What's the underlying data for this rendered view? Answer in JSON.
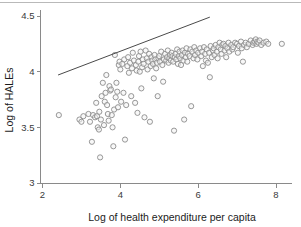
{
  "chart_data": {
    "type": "scatter",
    "title": "",
    "xlabel": "Log of health expenditure per capita",
    "ylabel": "Log of HALEs",
    "xlim": [
      2,
      8.5
    ],
    "ylim": [
      3,
      4.55
    ],
    "xticks": [
      2,
      4,
      6,
      8
    ],
    "xtick_labels": [
      "2",
      "4",
      "6",
      "8"
    ],
    "yticks": [
      3,
      3.5,
      4,
      4.5
    ],
    "ytick_labels": [
      "3",
      "3.5",
      "4",
      "4.5"
    ],
    "grid": false,
    "legend": null,
    "marker": {
      "shape": "circle-open",
      "radius_px": 2.6,
      "stroke_color": "#8c8c8c",
      "fill_color": "#f2f2f2"
    },
    "annotations": [
      {
        "type": "line",
        "name": "frontier-line",
        "color": "#4a4a4a",
        "x_start": 2.4,
        "y_start": 3.97,
        "x_end": 6.3,
        "y_end": 4.49
      }
    ],
    "points": [
      [
        2.42,
        3.61
      ],
      [
        2.95,
        3.57
      ],
      [
        3.0,
        3.55
      ],
      [
        3.05,
        3.6
      ],
      [
        3.18,
        3.62
      ],
      [
        3.22,
        3.55
      ],
      [
        3.27,
        3.37
      ],
      [
        3.3,
        3.61
      ],
      [
        3.35,
        3.59
      ],
      [
        3.38,
        3.72
      ],
      [
        3.4,
        3.6
      ],
      [
        3.42,
        3.5
      ],
      [
        3.45,
        3.48
      ],
      [
        3.46,
        3.64
      ],
      [
        3.48,
        3.23
      ],
      [
        3.5,
        3.57
      ],
      [
        3.52,
        3.78
      ],
      [
        3.55,
        3.9
      ],
      [
        3.58,
        3.52
      ],
      [
        3.6,
        3.73
      ],
      [
        3.62,
        3.81
      ],
      [
        3.64,
        3.97
      ],
      [
        3.66,
        3.7
      ],
      [
        3.68,
        3.62
      ],
      [
        3.7,
        3.56
      ],
      [
        3.72,
        3.87
      ],
      [
        3.74,
        3.83
      ],
      [
        3.76,
        3.84
      ],
      [
        3.78,
        3.61
      ],
      [
        3.8,
        3.5
      ],
      [
        3.82,
        3.33
      ],
      [
        3.84,
        3.66
      ],
      [
        3.86,
        4.15
      ],
      [
        3.88,
        3.77
      ],
      [
        3.9,
        3.9
      ],
      [
        3.92,
        3.82
      ],
      [
        3.94,
        3.68
      ],
      [
        3.96,
        4.06
      ],
      [
        3.98,
        4.09
      ],
      [
        4.0,
        4.02
      ],
      [
        4.02,
        3.73
      ],
      [
        4.05,
        4.07
      ],
      [
        4.08,
        3.81
      ],
      [
        4.1,
        4.11
      ],
      [
        4.12,
        3.39
      ],
      [
        4.15,
        3.7
      ],
      [
        4.18,
        4.05
      ],
      [
        4.2,
        4.13
      ],
      [
        4.22,
        3.99
      ],
      [
        4.25,
        4.08
      ],
      [
        4.28,
        3.78
      ],
      [
        4.3,
        4.03
      ],
      [
        4.32,
        4.17
      ],
      [
        4.35,
        4.1
      ],
      [
        4.38,
        3.72
      ],
      [
        4.4,
        4.06
      ],
      [
        4.42,
        4.01
      ],
      [
        4.44,
        3.63
      ],
      [
        4.46,
        4.09
      ],
      [
        4.48,
        4.14
      ],
      [
        4.5,
        4.0
      ],
      [
        4.52,
        4.18
      ],
      [
        4.54,
        3.85
      ],
      [
        4.56,
        4.04
      ],
      [
        4.58,
        4.11
      ],
      [
        4.6,
        4.07
      ],
      [
        4.62,
        3.59
      ],
      [
        4.65,
        4.19
      ],
      [
        4.68,
        4.12
      ],
      [
        4.7,
        4.02
      ],
      [
        4.72,
        4.09
      ],
      [
        4.74,
        4.16
      ],
      [
        4.76,
        3.55
      ],
      [
        4.78,
        4.05
      ],
      [
        4.8,
        4.13
      ],
      [
        4.82,
        4.1
      ],
      [
        4.84,
        4.07
      ],
      [
        4.86,
        3.94
      ],
      [
        4.88,
        4.15
      ],
      [
        4.9,
        4.11
      ],
      [
        4.92,
        4.03
      ],
      [
        4.94,
        4.08
      ],
      [
        4.96,
        3.78
      ],
      [
        4.98,
        4.12
      ],
      [
        5.0,
        4.14
      ],
      [
        5.02,
        4.09
      ],
      [
        5.05,
        4.18
      ],
      [
        5.08,
        4.06
      ],
      [
        5.1,
        3.91
      ],
      [
        5.12,
        4.11
      ],
      [
        5.15,
        4.16
      ],
      [
        5.18,
        4.1
      ],
      [
        5.2,
        4.13
      ],
      [
        5.22,
        4.19
      ],
      [
        5.24,
        4.08
      ],
      [
        5.26,
        4.12
      ],
      [
        5.28,
        4.15
      ],
      [
        5.3,
        4.1
      ],
      [
        5.32,
        4.17
      ],
      [
        5.34,
        4.14
      ],
      [
        5.36,
        4.09
      ],
      [
        5.38,
        3.47
      ],
      [
        5.4,
        4.13
      ],
      [
        5.42,
        4.16
      ],
      [
        5.44,
        4.11
      ],
      [
        5.46,
        4.2
      ],
      [
        5.48,
        4.07
      ],
      [
        5.5,
        4.14
      ],
      [
        5.52,
        4.18
      ],
      [
        5.54,
        4.12
      ],
      [
        5.56,
        4.06
      ],
      [
        5.58,
        4.15
      ],
      [
        5.6,
        4.19
      ],
      [
        5.62,
        4.1
      ],
      [
        5.64,
        3.57
      ],
      [
        5.66,
        4.17
      ],
      [
        5.68,
        4.13
      ],
      [
        5.7,
        4.21
      ],
      [
        5.72,
        4.09
      ],
      [
        5.74,
        4.16
      ],
      [
        5.78,
        4.14
      ],
      [
        5.8,
        4.2
      ],
      [
        5.82,
        3.69
      ],
      [
        5.85,
        4.18
      ],
      [
        5.88,
        4.12
      ],
      [
        5.9,
        4.22
      ],
      [
        5.92,
        4.15
      ],
      [
        5.95,
        4.19
      ],
      [
        5.98,
        4.11
      ],
      [
        6.0,
        4.17
      ],
      [
        6.05,
        4.21
      ],
      [
        6.08,
        4.14
      ],
      [
        6.1,
        4.18
      ],
      [
        6.12,
        4.05
      ],
      [
        6.15,
        4.22
      ],
      [
        6.18,
        4.16
      ],
      [
        6.2,
        4.1
      ],
      [
        6.22,
        4.2
      ],
      [
        6.25,
        4.08
      ],
      [
        6.28,
        4.17
      ],
      [
        6.3,
        3.95
      ],
      [
        6.32,
        4.23
      ],
      [
        6.35,
        4.13
      ],
      [
        6.38,
        4.19
      ],
      [
        6.4,
        4.21
      ],
      [
        6.42,
        4.15
      ],
      [
        6.45,
        4.24
      ],
      [
        6.48,
        4.18
      ],
      [
        6.5,
        4.12
      ],
      [
        6.52,
        4.22
      ],
      [
        6.55,
        4.26
      ],
      [
        6.58,
        4.2
      ],
      [
        6.6,
        4.16
      ],
      [
        6.62,
        4.24
      ],
      [
        6.65,
        4.25
      ],
      [
        6.68,
        4.19
      ],
      [
        6.7,
        4.23
      ],
      [
        6.72,
        4.13
      ],
      [
        6.75,
        4.21
      ],
      [
        6.78,
        4.26
      ],
      [
        6.8,
        4.18
      ],
      [
        6.85,
        4.24
      ],
      [
        6.88,
        4.2
      ],
      [
        6.9,
        4.22
      ],
      [
        6.95,
        4.26
      ],
      [
        7.0,
        4.25
      ],
      [
        7.02,
        4.17
      ],
      [
        7.05,
        4.23
      ],
      [
        7.1,
        4.27
      ],
      [
        7.12,
        4.21
      ],
      [
        7.15,
        4.09
      ],
      [
        7.18,
        4.24
      ],
      [
        7.22,
        4.26
      ],
      [
        7.25,
        4.22
      ],
      [
        7.3,
        4.25
      ],
      [
        7.35,
        4.28
      ],
      [
        7.4,
        4.24
      ],
      [
        7.42,
        4.26
      ],
      [
        7.45,
        4.27
      ],
      [
        7.48,
        4.29
      ],
      [
        7.5,
        4.25
      ],
      [
        7.52,
        4.27
      ],
      [
        7.55,
        4.26
      ],
      [
        7.58,
        4.28
      ],
      [
        7.62,
        4.24
      ],
      [
        7.68,
        4.26
      ],
      [
        7.75,
        4.27
      ],
      [
        7.8,
        4.25
      ],
      [
        8.15,
        4.25
      ]
    ]
  },
  "figure": {
    "background_color": "#ffffff",
    "axis_color": "#8a8a8a",
    "text_color": "#1c1c1c"
  }
}
